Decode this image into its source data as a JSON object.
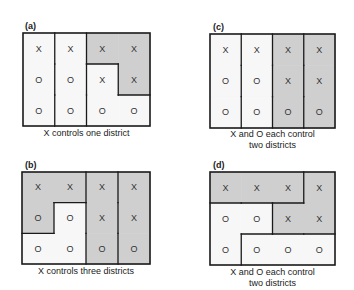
{
  "colors": {
    "shaded": "#cfcfcf",
    "unshaded": "#f7f7f7",
    "border": "#1a1a1a",
    "symbol": "#333333"
  },
  "panels": [
    {
      "id": "a",
      "label": "(a)",
      "caption_lines": [
        "X controls one district"
      ],
      "box": {
        "x": 23,
        "y": 33,
        "w": 127,
        "h": 93
      },
      "label_pos": {
        "x": 25,
        "y": 21
      },
      "caption_pos": {
        "y": 128
      },
      "grid": [
        [
          "X",
          "X",
          "X",
          "X"
        ],
        [
          "O",
          "O",
          "X",
          "X"
        ],
        [
          "O",
          "O",
          "O",
          "O"
        ]
      ],
      "shaded": [
        [
          false,
          false,
          true,
          true
        ],
        [
          false,
          false,
          false,
          true
        ],
        [
          false,
          false,
          false,
          false
        ]
      ],
      "districts": [
        [
          [
            0,
            0
          ],
          [
            1,
            0
          ],
          [
            2,
            0
          ]
        ],
        [
          [
            0,
            1
          ],
          [
            1,
            1
          ],
          [
            2,
            1
          ]
        ],
        [
          [
            0,
            2
          ],
          [
            0,
            3
          ],
          [
            1,
            3
          ]
        ],
        [
          [
            1,
            2
          ],
          [
            2,
            2
          ],
          [
            2,
            3
          ]
        ]
      ]
    },
    {
      "id": "b",
      "label": "(b)",
      "caption_lines": [
        "X controls three districts"
      ],
      "box": {
        "x": 22,
        "y": 172,
        "w": 128,
        "h": 92
      },
      "label_pos": {
        "x": 25,
        "y": 160
      },
      "caption_pos": {
        "y": 266
      },
      "grid": [
        [
          "X",
          "X",
          "X",
          "X"
        ],
        [
          "O",
          "O",
          "X",
          "X"
        ],
        [
          "O",
          "O",
          "O",
          "O"
        ]
      ],
      "shaded": [
        [
          true,
          true,
          true,
          true
        ],
        [
          true,
          false,
          true,
          true
        ],
        [
          false,
          false,
          true,
          true
        ]
      ],
      "districts": [
        [
          [
            0,
            0
          ],
          [
            0,
            1
          ],
          [
            1,
            0
          ]
        ],
        [
          [
            1,
            1
          ],
          [
            2,
            0
          ],
          [
            2,
            1
          ]
        ],
        [
          [
            0,
            2
          ],
          [
            1,
            2
          ],
          [
            2,
            2
          ]
        ],
        [
          [
            0,
            3
          ],
          [
            1,
            3
          ],
          [
            2,
            3
          ]
        ]
      ]
    },
    {
      "id": "c",
      "label": "(c)",
      "caption_lines": [
        "X and O each control",
        "two districts"
      ],
      "box": {
        "x": 210,
        "y": 34,
        "w": 125,
        "h": 94
      },
      "label_pos": {
        "x": 213,
        "y": 22
      },
      "caption_pos": {
        "y": 129
      },
      "grid": [
        [
          "X",
          "X",
          "X",
          "X"
        ],
        [
          "O",
          "O",
          "X",
          "X"
        ],
        [
          "O",
          "O",
          "O",
          "O"
        ]
      ],
      "shaded": [
        [
          false,
          false,
          true,
          true
        ],
        [
          false,
          false,
          true,
          true
        ],
        [
          false,
          false,
          true,
          true
        ]
      ],
      "districts": [
        [
          [
            0,
            0
          ],
          [
            1,
            0
          ],
          [
            2,
            0
          ]
        ],
        [
          [
            0,
            1
          ],
          [
            1,
            1
          ],
          [
            2,
            1
          ]
        ],
        [
          [
            0,
            2
          ],
          [
            1,
            2
          ],
          [
            2,
            2
          ]
        ],
        [
          [
            0,
            3
          ],
          [
            1,
            3
          ],
          [
            2,
            3
          ]
        ]
      ]
    },
    {
      "id": "d",
      "label": "(d)",
      "caption_lines": [
        "X and O each control",
        "two districts"
      ],
      "box": {
        "x": 210,
        "y": 172,
        "w": 125,
        "h": 93
      },
      "label_pos": {
        "x": 213,
        "y": 160
      },
      "caption_pos": {
        "y": 267
      },
      "grid": [
        [
          "X",
          "X",
          "X",
          "X"
        ],
        [
          "O",
          "O",
          "X",
          "X"
        ],
        [
          "O",
          "O",
          "O",
          "O"
        ]
      ],
      "shaded": [
        [
          true,
          true,
          true,
          true
        ],
        [
          false,
          false,
          true,
          true
        ],
        [
          false,
          false,
          false,
          false
        ]
      ],
      "districts": [
        [
          [
            0,
            0
          ],
          [
            0,
            1
          ],
          [
            0,
            2
          ]
        ],
        [
          [
            0,
            3
          ],
          [
            1,
            2
          ],
          [
            1,
            3
          ]
        ],
        [
          [
            1,
            0
          ],
          [
            1,
            1
          ],
          [
            2,
            0
          ]
        ],
        [
          [
            2,
            1
          ],
          [
            2,
            2
          ],
          [
            2,
            3
          ]
        ]
      ]
    }
  ]
}
